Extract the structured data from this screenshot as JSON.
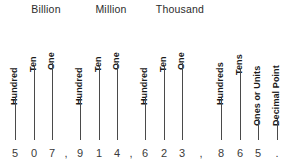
{
  "number": "507,914,623,865.",
  "colors": {
    "background": "#ffffff",
    "text": "#231f20",
    "line": "#4a4a4a",
    "digit": "#3a3a3a"
  },
  "groups": [
    {
      "label": "Billion",
      "x": 13,
      "width": 66
    },
    {
      "label": "Million",
      "x": 78,
      "width": 66
    },
    {
      "label": "Thousand",
      "x": 143,
      "width": 74
    }
  ],
  "places": [
    {
      "label": "Hundred",
      "x": 15,
      "label_bottom": 96,
      "line_top": 98,
      "line_bottom": 140
    },
    {
      "label": "Ten",
      "x": 34,
      "label_bottom": 63,
      "line_top": 65,
      "line_bottom": 140
    },
    {
      "label": "One",
      "x": 52,
      "label_bottom": 61,
      "line_top": 63,
      "line_bottom": 140
    },
    {
      "label": "Hundred",
      "x": 80,
      "label_bottom": 96,
      "line_top": 98,
      "line_bottom": 140
    },
    {
      "label": "Ten",
      "x": 99,
      "label_bottom": 63,
      "line_top": 65,
      "line_bottom": 140
    },
    {
      "label": "One",
      "x": 117,
      "label_bottom": 61,
      "line_top": 63,
      "line_bottom": 140
    },
    {
      "label": "Hundred",
      "x": 145,
      "label_bottom": 96,
      "line_top": 98,
      "line_bottom": 140
    },
    {
      "label": "Ten",
      "x": 164,
      "label_bottom": 63,
      "line_top": 65,
      "line_bottom": 140
    },
    {
      "label": "One",
      "x": 182,
      "label_bottom": 61,
      "line_top": 63,
      "line_bottom": 140
    },
    {
      "label": "Hundreds",
      "x": 221,
      "label_bottom": 96,
      "line_top": 98,
      "line_bottom": 140
    },
    {
      "label": "Tens",
      "x": 240,
      "label_bottom": 66,
      "line_top": 68,
      "line_bottom": 140
    },
    {
      "label": "Ones or Units",
      "x": 258,
      "label_bottom": 117,
      "line_top": 119,
      "line_bottom": 140
    },
    {
      "label": "Decimal Point",
      "x": 277,
      "label_bottom": 117,
      "line_top": 119,
      "line_bottom": 140
    }
  ],
  "digits": [
    {
      "char": "5",
      "x": 15,
      "separator": false
    },
    {
      "char": "0",
      "x": 34,
      "separator": false
    },
    {
      "char": "7",
      "x": 52,
      "separator": false
    },
    {
      "char": ",",
      "x": 66,
      "separator": true
    },
    {
      "char": "9",
      "x": 80,
      "separator": false
    },
    {
      "char": "1",
      "x": 99,
      "separator": false
    },
    {
      "char": "4",
      "x": 117,
      "separator": false
    },
    {
      "char": ",",
      "x": 131,
      "separator": true
    },
    {
      "char": "6",
      "x": 145,
      "separator": false
    },
    {
      "char": "2",
      "x": 164,
      "separator": false
    },
    {
      "char": "3",
      "x": 182,
      "separator": false
    },
    {
      "char": ",",
      "x": 201,
      "separator": true
    },
    {
      "char": "8",
      "x": 221,
      "separator": false
    },
    {
      "char": "6",
      "x": 240,
      "separator": false
    },
    {
      "char": "5",
      "x": 258,
      "separator": false
    },
    {
      "char": ".",
      "x": 277,
      "separator": true
    }
  ]
}
